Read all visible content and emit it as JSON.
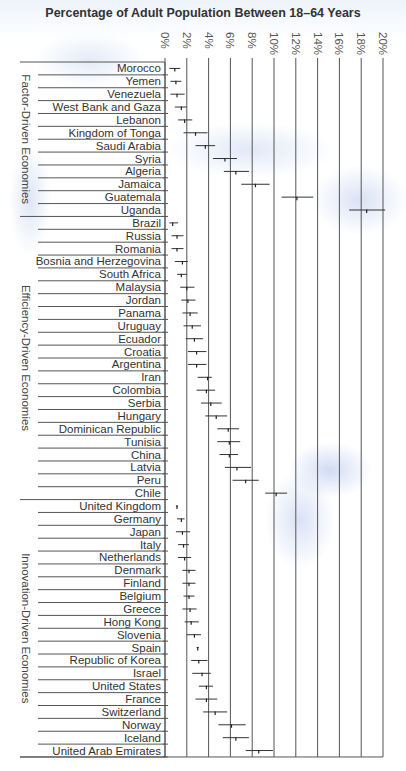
{
  "chart_data": {
    "type": "errorbar",
    "title": "Percentage of Adult Population Between 18–64 Years",
    "xlabel": "",
    "ylabel": "",
    "xlim": [
      0,
      20
    ],
    "x_ticks": [
      "0%",
      "2%",
      "4%",
      "6%",
      "8%",
      "10%",
      "12%",
      "14%",
      "16%",
      "18%",
      "20%"
    ],
    "grid": true,
    "legend": null,
    "groups": [
      {
        "name": "Factor-Driven Economies",
        "items": [
          {
            "label": "Morocco",
            "value": 0.9,
            "low": 0.4,
            "high": 1.4
          },
          {
            "label": "Yemen",
            "value": 1.0,
            "low": 0.5,
            "high": 1.5
          },
          {
            "label": "Venezuela",
            "value": 1.1,
            "low": 0.5,
            "high": 1.8
          },
          {
            "label": "West Bank and Gaza",
            "value": 1.5,
            "low": 0.9,
            "high": 2.0
          },
          {
            "label": "Lebanon",
            "value": 1.8,
            "low": 1.2,
            "high": 2.5
          },
          {
            "label": "Kingdom of Tonga",
            "value": 2.8,
            "low": 1.7,
            "high": 3.9
          },
          {
            "label": "Saudi Arabia",
            "value": 3.7,
            "low": 2.8,
            "high": 4.6
          },
          {
            "label": "Syria",
            "value": 5.5,
            "low": 4.4,
            "high": 6.6
          },
          {
            "label": "Algeria",
            "value": 6.5,
            "low": 5.4,
            "high": 7.7
          },
          {
            "label": "Jamaica",
            "value": 8.3,
            "low": 7.0,
            "high": 9.6
          },
          {
            "label": "Guatemala",
            "value": 12.1,
            "low": 10.7,
            "high": 13.6
          },
          {
            "label": "Uganda",
            "value": 18.5,
            "low": 16.9,
            "high": 20.2
          }
        ]
      },
      {
        "name": "Efficiency-Driven Economies",
        "items": [
          {
            "label": "Brazil",
            "value": 0.7,
            "low": 0.4,
            "high": 1.2
          },
          {
            "label": "Russia",
            "value": 1.1,
            "low": 0.6,
            "high": 1.7
          },
          {
            "label": "Romania",
            "value": 1.1,
            "low": 0.6,
            "high": 1.7
          },
          {
            "label": "Bosnia and Herzegovina",
            "value": 1.6,
            "low": 0.9,
            "high": 2.1
          },
          {
            "label": "South Africa",
            "value": 1.5,
            "low": 1.1,
            "high": 2.0
          },
          {
            "label": "Malaysia",
            "value": 2.0,
            "low": 1.4,
            "high": 2.7
          },
          {
            "label": "Jordan",
            "value": 2.1,
            "low": 1.5,
            "high": 2.8
          },
          {
            "label": "Panama",
            "value": 2.3,
            "low": 1.6,
            "high": 3.0
          },
          {
            "label": "Uruguay",
            "value": 2.5,
            "low": 1.7,
            "high": 3.3
          },
          {
            "label": "Ecuador",
            "value": 2.7,
            "low": 1.9,
            "high": 3.5
          },
          {
            "label": "Croatia",
            "value": 2.9,
            "low": 2.1,
            "high": 3.8
          },
          {
            "label": "Argentina",
            "value": 2.9,
            "low": 2.1,
            "high": 3.8
          },
          {
            "label": "Iran",
            "value": 3.9,
            "low": 3.0,
            "high": 4.3
          },
          {
            "label": "Colombia",
            "value": 3.8,
            "low": 2.9,
            "high": 4.6
          },
          {
            "label": "Serbia",
            "value": 4.2,
            "low": 3.3,
            "high": 5.2
          },
          {
            "label": "Hungary",
            "value": 4.7,
            "low": 3.7,
            "high": 5.7
          },
          {
            "label": "Dominican Republic",
            "value": 5.8,
            "low": 4.8,
            "high": 6.8
          },
          {
            "label": "Tunisia",
            "value": 5.9,
            "low": 4.8,
            "high": 6.9
          },
          {
            "label": "China",
            "value": 5.9,
            "low": 5.0,
            "high": 6.7
          },
          {
            "label": "Latvia",
            "value": 6.6,
            "low": 5.5,
            "high": 7.9
          },
          {
            "label": "Peru",
            "value": 7.4,
            "low": 6.2,
            "high": 8.6
          },
          {
            "label": "Chile",
            "value": 10.2,
            "low": 9.2,
            "high": 11.2
          }
        ]
      },
      {
        "name": "Innovation-Driven Economies",
        "items": [
          {
            "label": "United Kingdom",
            "value": 1.1,
            "low": 1.0,
            "high": 1.2
          },
          {
            "label": "Germany",
            "value": 1.5,
            "low": 1.1,
            "high": 1.8
          },
          {
            "label": "Japan",
            "value": 1.6,
            "low": 1.0,
            "high": 2.3
          },
          {
            "label": "Italy",
            "value": 1.7,
            "low": 1.2,
            "high": 2.2
          },
          {
            "label": "Netherlands",
            "value": 1.8,
            "low": 1.2,
            "high": 2.4
          },
          {
            "label": "Denmark",
            "value": 2.2,
            "low": 1.6,
            "high": 2.8
          },
          {
            "label": "Finland",
            "value": 2.2,
            "low": 1.6,
            "high": 2.8
          },
          {
            "label": "Belgium",
            "value": 2.2,
            "low": 1.7,
            "high": 2.7
          },
          {
            "label": "Greece",
            "value": 2.3,
            "low": 1.6,
            "high": 2.9
          },
          {
            "label": "Hong Kong",
            "value": 2.4,
            "low": 1.8,
            "high": 3.1
          },
          {
            "label": "Slovenia",
            "value": 2.7,
            "low": 2.0,
            "high": 3.3
          },
          {
            "label": "Spain",
            "value": 3.0,
            "low": 2.9,
            "high": 3.1
          },
          {
            "label": "Republic of Korea",
            "value": 3.1,
            "low": 2.4,
            "high": 3.9
          },
          {
            "label": "Israel",
            "value": 3.4,
            "low": 2.5,
            "high": 4.2
          },
          {
            "label": "United States",
            "value": 3.8,
            "low": 3.1,
            "high": 4.4
          },
          {
            "label": "France",
            "value": 3.8,
            "low": 2.8,
            "high": 4.8
          },
          {
            "label": "Switzerland",
            "value": 4.6,
            "low": 3.5,
            "high": 5.7
          },
          {
            "label": "Norway",
            "value": 6.1,
            "low": 4.9,
            "high": 7.4
          },
          {
            "label": "Iceland",
            "value": 6.5,
            "low": 5.3,
            "high": 7.7
          },
          {
            "label": "United Arab Emirates",
            "value": 8.6,
            "low": 7.4,
            "high": 9.9
          }
        ]
      }
    ]
  }
}
